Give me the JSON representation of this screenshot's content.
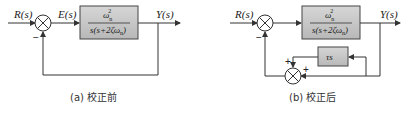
{
  "diagram_a": {
    "caption": "(a) 校正前",
    "input_label": "R(s)",
    "error_label": "E(s)",
    "output_label": "Y(s)",
    "feedback_sign": "−",
    "plant": {
      "numerator": "ω",
      "num_sup": "2",
      "num_sub": "n",
      "denominator": "s(s+2ζω",
      "den_sub": "n",
      "den_close": ")"
    }
  },
  "diagram_b": {
    "caption": "(b) 校正后",
    "input_label": "R(s)",
    "output_label": "Y(s)",
    "feedback_sign": "−",
    "plant": {
      "numerator": "ω",
      "num_sup": "2",
      "num_sub": "n",
      "denominator": "s(s+2ζω",
      "den_sub": "n",
      "den_close": ")"
    },
    "compensator": "τs",
    "inner_sum_sign_top": "+",
    "inner_sum_sign_right": "+"
  },
  "colors": {
    "block_fill": "#c8c8c8",
    "line": "#333333"
  }
}
